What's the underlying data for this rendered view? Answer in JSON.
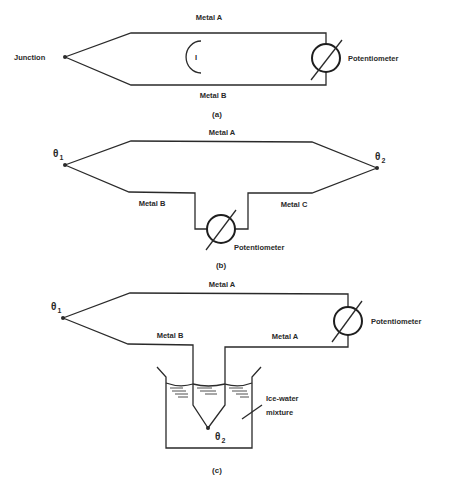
{
  "figure": {
    "panel_a": {
      "caption": "(a)",
      "labels": {
        "junction": "Junction",
        "top_wire": "Metal A",
        "bottom_wire": "Metal B",
        "meter": "Potentiometer",
        "current": "I"
      }
    },
    "panel_b": {
      "caption": "(b)",
      "labels": {
        "theta1": "θ",
        "theta1_sub": "1",
        "theta2": "θ",
        "theta2_sub": "2",
        "top_wire": "Metal A",
        "left_wire": "Metal B",
        "right_wire": "Metal C",
        "meter": "Potentiometer"
      }
    },
    "panel_c": {
      "caption": "(c)",
      "labels": {
        "theta1": "θ",
        "theta1_sub": "1",
        "theta2": "θ",
        "theta2_sub": "2",
        "top_wire": "Metal A",
        "left_wire": "Metal B",
        "right_wire": "Metal A",
        "meter": "Potentiometer",
        "bath_line1": "Ice-water",
        "bath_line2": "mixture"
      }
    }
  },
  "colors": {
    "ink": "#2a2a2a",
    "paper": "#ffffff"
  }
}
